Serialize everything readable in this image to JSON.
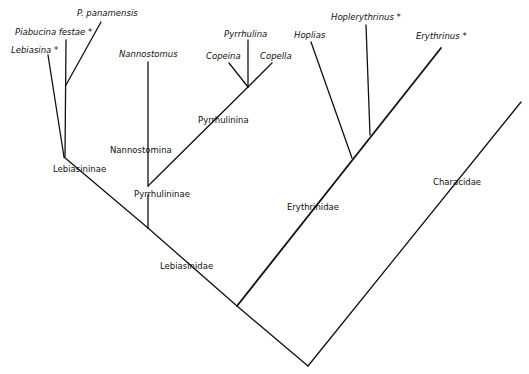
{
  "diagram": {
    "type": "cladogram",
    "line_color": "#111111",
    "background": "#ffffff",
    "taxa": [
      {
        "id": "lebiasina",
        "label": "Lebiasina *"
      },
      {
        "id": "piabucina_festae",
        "label": "Piabucina festae *"
      },
      {
        "id": "p_panamensis",
        "label": "P. panamensis"
      },
      {
        "id": "nannostomus",
        "label": "Nannostomus"
      },
      {
        "id": "pyrrhulina",
        "label": "Pyrrhulina"
      },
      {
        "id": "copeina",
        "label": "Copeina"
      },
      {
        "id": "copella",
        "label": "Copella"
      },
      {
        "id": "hoplias",
        "label": "Hoplias"
      },
      {
        "id": "hoplerythrinus",
        "label": "Hoplerythrinus *"
      },
      {
        "id": "erythrinus",
        "label": "Erythrinus *"
      }
    ],
    "clades": [
      {
        "id": "lebiasininae",
        "label": "Lebiasininae"
      },
      {
        "id": "nannostomina",
        "label": "Nannostomina"
      },
      {
        "id": "pyrrhulinina",
        "label": "Pyrrhulinina"
      },
      {
        "id": "pyrrhulininae",
        "label": "Pyrrhulininae"
      },
      {
        "id": "lebiasinidae",
        "label": "Lebiasinidae"
      },
      {
        "id": "erythrinidae",
        "label": "Erythrinidae"
      },
      {
        "id": "characidae",
        "label": "Characidae"
      }
    ]
  }
}
